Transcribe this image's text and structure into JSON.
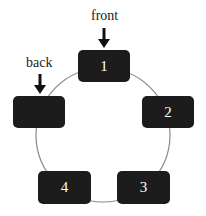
{
  "diagram": {
    "pointers": [
      {
        "label": "front",
        "target": "1"
      },
      {
        "label": "back",
        "target": "5"
      }
    ],
    "nodes": [
      {
        "label": "1"
      },
      {
        "label": "2"
      },
      {
        "label": "3"
      },
      {
        "label": "4"
      },
      {
        "label": ""
      }
    ],
    "colors": {
      "node": "#1c1c1c",
      "ring": "#888888",
      "text": "#ffffff"
    }
  }
}
